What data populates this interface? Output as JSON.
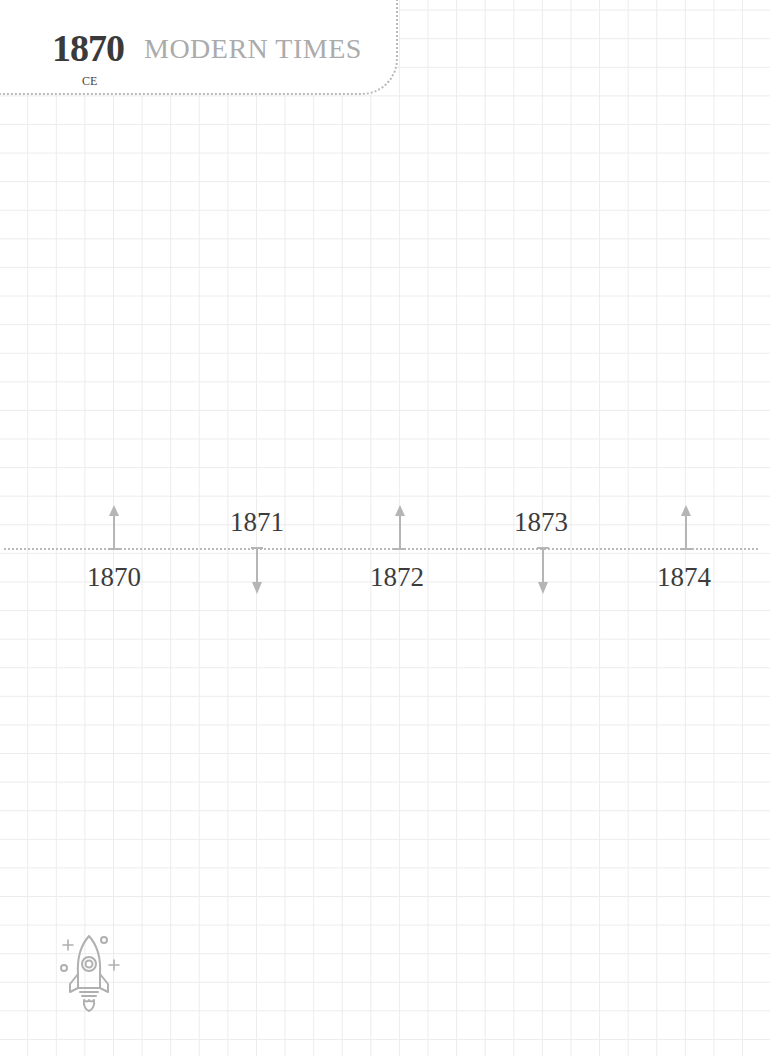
{
  "header": {
    "year": "1870",
    "era": "CE",
    "period_title": "MODERN TIMES"
  },
  "timeline": {
    "line_color": "#b9b9b9",
    "arrow_color": "#b5b5b5",
    "items": [
      {
        "year": "1870",
        "arrow": "up",
        "label_position": "below",
        "x": 114
      },
      {
        "year": "1871",
        "arrow": "down",
        "label_position": "above",
        "x": 257
      },
      {
        "year": "1872",
        "arrow": "up",
        "label_position": "below",
        "x": 400
      },
      {
        "year": "1873",
        "arrow": "down",
        "label_position": "above",
        "x": 543
      },
      {
        "year": "1874",
        "arrow": "up",
        "label_position": "below",
        "x": 686
      }
    ]
  },
  "decoration": {
    "icon": "rocket-icon"
  }
}
